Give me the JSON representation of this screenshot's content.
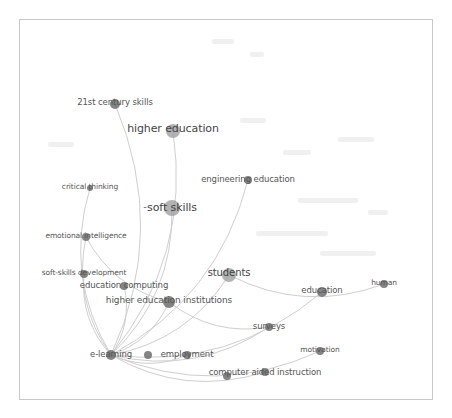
{
  "diagram": {
    "type": "co-occurrence network",
    "frame": {
      "x": 19,
      "y": 19,
      "w": 414,
      "h": 381,
      "border_color": "#c8c8c8"
    },
    "colors": {
      "node": "#8e8e8e",
      "node_dark": "#6e6e6e",
      "edge": "#cfcfcf",
      "label": "#555555",
      "ghost": "#ececec"
    },
    "nodes": [
      {
        "id": "21st-century-skills",
        "label": "21st century skills",
        "x": 115,
        "y": 104,
        "r": 5,
        "fs": 8.5,
        "lx": 115,
        "ly": 102
      },
      {
        "id": "higher-education",
        "label": "higher education",
        "x": 173,
        "y": 131,
        "r": 7,
        "fs": 11,
        "lx": 173,
        "ly": 128
      },
      {
        "id": "engineering-education",
        "label": "engineering education",
        "x": 248,
        "y": 180,
        "r": 4,
        "fs": 8.5,
        "lx": 248,
        "ly": 179
      },
      {
        "id": "critical-thinking",
        "label": "critical thinking",
        "x": 90,
        "y": 188,
        "r": 3,
        "fs": 7.5,
        "lx": 90,
        "ly": 187
      },
      {
        "id": "soft-skills",
        "label": "soft skills",
        "x": 172,
        "y": 208,
        "r": 8,
        "fs": 11,
        "lx": 172,
        "ly": 207
      },
      {
        "id": "emotional-intelligence",
        "label": "emotional intelligence",
        "x": 86,
        "y": 237,
        "r": 4,
        "fs": 7.5,
        "lx": 86,
        "ly": 236
      },
      {
        "id": "soft-skills-development",
        "label": "soft-skills development",
        "x": 84,
        "y": 274,
        "r": 4,
        "fs": 7.5,
        "lx": 84,
        "ly": 273
      },
      {
        "id": "education-computing",
        "label": "education computing",
        "x": 124,
        "y": 286,
        "r": 4,
        "fs": 8.5,
        "lx": 124,
        "ly": 285
      },
      {
        "id": "students",
        "label": "students",
        "x": 229,
        "y": 275,
        "r": 7,
        "fs": 10,
        "lx": 229,
        "ly": 273
      },
      {
        "id": "human",
        "label": "human",
        "x": 384,
        "y": 284,
        "r": 4,
        "fs": 7.5,
        "lx": 384,
        "ly": 283
      },
      {
        "id": "education",
        "label": "education",
        "x": 322,
        "y": 292,
        "r": 5,
        "fs": 8.5,
        "lx": 322,
        "ly": 290
      },
      {
        "id": "higher-education-institutions",
        "label": "higher education institutions",
        "x": 169,
        "y": 302,
        "r": 6,
        "fs": 9,
        "lx": 169,
        "ly": 300
      },
      {
        "id": "surveys",
        "label": "surveys",
        "x": 269,
        "y": 327,
        "r": 4,
        "fs": 8.5,
        "lx": 269,
        "ly": 326
      },
      {
        "id": "motivation",
        "label": "motivation",
        "x": 320,
        "y": 351,
        "r": 4,
        "fs": 7.5,
        "lx": 320,
        "ly": 350
      },
      {
        "id": "e-learning",
        "label": "e-learning",
        "x": 111,
        "y": 355,
        "r": 5,
        "fs": 8.5,
        "lx": 111,
        "ly": 354
      },
      {
        "id": "unlabeled",
        "label": "",
        "x": 148,
        "y": 355,
        "r": 4,
        "fs": 8,
        "lx": 148,
        "ly": 355
      },
      {
        "id": "employment",
        "label": "employment",
        "x": 187,
        "y": 355,
        "r": 4,
        "fs": 8.5,
        "lx": 187,
        "ly": 354
      },
      {
        "id": "computer-aided-instruction-a",
        "label": "",
        "x": 227,
        "y": 376,
        "r": 4,
        "fs": 8,
        "lx": 227,
        "ly": 376
      },
      {
        "id": "computer-aided-instruction",
        "label": "computer aided instruction",
        "x": 265,
        "y": 372,
        "r": 4,
        "fs": 8.5,
        "lx": 265,
        "ly": 372
      }
    ],
    "soft_skills_marker": "-",
    "edges": [
      [
        "e-learning",
        "21st-century-skills"
      ],
      [
        "e-learning",
        "higher-education"
      ],
      [
        "e-learning",
        "critical-thinking"
      ],
      [
        "e-learning",
        "soft-skills"
      ],
      [
        "e-learning",
        "emotional-intelligence"
      ],
      [
        "e-learning",
        "soft-skills-development"
      ],
      [
        "e-learning",
        "education-computing"
      ],
      [
        "e-learning",
        "engineering-education"
      ],
      [
        "e-learning",
        "students"
      ],
      [
        "e-learning",
        "higher-education-institutions"
      ],
      [
        "e-learning",
        "surveys"
      ],
      [
        "e-learning",
        "motivation"
      ],
      [
        "e-learning",
        "employment"
      ],
      [
        "e-learning",
        "computer-aided-instruction"
      ],
      [
        "e-learning",
        "education"
      ],
      [
        "students",
        "human"
      ],
      [
        "emotional-intelligence",
        "higher-education-institutions"
      ],
      [
        "higher-education-institutions",
        "surveys"
      ]
    ],
    "ghost_labels": [
      {
        "x": 212,
        "y": 39,
        "w": 22
      },
      {
        "x": 250,
        "y": 52,
        "w": 14
      },
      {
        "x": 240,
        "y": 118,
        "w": 26
      },
      {
        "x": 48,
        "y": 142,
        "w": 26
      },
      {
        "x": 338,
        "y": 137,
        "w": 36
      },
      {
        "x": 283,
        "y": 150,
        "w": 28
      },
      {
        "x": 298,
        "y": 198,
        "w": 60
      },
      {
        "x": 368,
        "y": 210,
        "w": 20
      },
      {
        "x": 256,
        "y": 231,
        "w": 72
      },
      {
        "x": 320,
        "y": 251,
        "w": 56
      }
    ]
  }
}
